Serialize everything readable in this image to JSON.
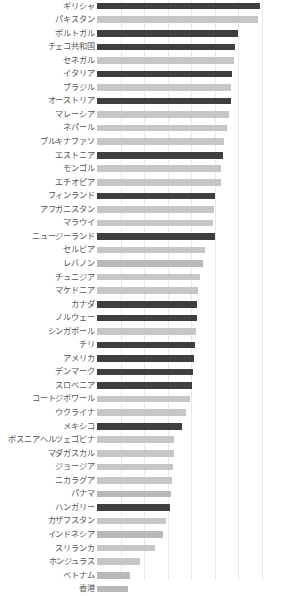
{
  "chart_data": {
    "type": "bar",
    "orientation": "horizontal",
    "title": "",
    "subtitle": "",
    "xlabel": "",
    "ylabel": "",
    "grid": true,
    "grid_axis": "x",
    "legend": "none",
    "xlim": [
      0,
      8
    ],
    "xticks": [
      0,
      1,
      2,
      3,
      4,
      5,
      6,
      7,
      8
    ],
    "xtick_labels": [
      "",
      "",
      "",
      "",
      "",
      "",
      "",
      "",
      ""
    ],
    "categories": [
      "ギリシャ",
      "パキスタン",
      "ポルトガル",
      "チェコ共和国",
      "セネガル",
      "イタリア",
      "ブラジル",
      "オーストリア",
      "マレーシア",
      "ネパール",
      "ブルキナファソ",
      "エストニア",
      "モンゴル",
      "エチオピア",
      "フィンランド",
      "アフガニスタン",
      "マラウイ",
      "ニュージーランド",
      "セルビア",
      "レバノン",
      "チュニジア",
      "マケドニア",
      "カナダ",
      "ノルウェー",
      "シンガポール",
      "チリ",
      "アメリカ",
      "デンマーク",
      "スロベニア",
      "コートジボワール",
      "ウクライナ",
      "メキシコ",
      "ボスニアヘルツェゴビナ",
      "マダガスカル",
      "ジョージア",
      "ニカラグア",
      "パナマ",
      "ハンガリー",
      "カザフスタン",
      "インドネシア",
      "スリランカ",
      "ホンジュラス",
      "ベトナム",
      "香港"
    ],
    "values": [
      6.93,
      6.85,
      6.0,
      5.88,
      5.82,
      5.72,
      5.7,
      5.68,
      5.62,
      5.52,
      5.38,
      5.33,
      5.28,
      5.25,
      5.0,
      4.95,
      4.92,
      5.0,
      4.58,
      4.48,
      4.38,
      4.3,
      4.25,
      4.25,
      4.22,
      4.15,
      4.12,
      4.08,
      4.05,
      3.95,
      3.8,
      3.62,
      3.28,
      3.25,
      3.22,
      3.18,
      3.15,
      3.1,
      2.92,
      2.8,
      2.45,
      1.82,
      1.42,
      1.3
    ],
    "bar_colors": [
      "#3f3f3f",
      "#c6c6c6",
      "#3f3f3f",
      "#3f3f3f",
      "#c6c6c6",
      "#3f3f3f",
      "#c6c6c6",
      "#3f3f3f",
      "#c6c6c6",
      "#c6c6c6",
      "#c6c6c6",
      "#3f3f3f",
      "#c6c6c6",
      "#c6c6c6",
      "#3f3f3f",
      "#c6c6c6",
      "#c6c6c6",
      "#3f3f3f",
      "#c6c6c6",
      "#b9b9b9",
      "#c6c6c6",
      "#c6c6c6",
      "#3f3f3f",
      "#3f3f3f",
      "#c6c6c6",
      "#3f3f3f",
      "#3f3f3f",
      "#3f3f3f",
      "#3f3f3f",
      "#c6c6c6",
      "#c6c6c6",
      "#3f3f3f",
      "#c6c6c6",
      "#c6c6c6",
      "#c6c6c6",
      "#c6c6c6",
      "#b9b9b9",
      "#3f3f3f",
      "#c6c6c6",
      "#b9b9b9",
      "#c6c6c6",
      "#c6c6c6",
      "#b9b9b9",
      "#b9b9b9"
    ],
    "colors": {
      "dark_bar": "#3f3f3f",
      "light_bar": "#c6c6c6",
      "mid_bar": "#b9b9b9",
      "gridline": "#e9e9e9",
      "label_text": "#555555",
      "background": "#ffffff"
    }
  }
}
